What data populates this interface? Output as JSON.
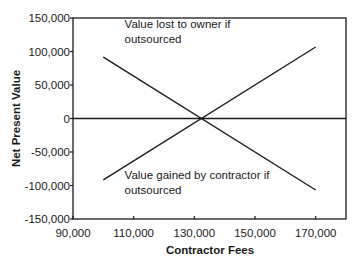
{
  "chart_data": {
    "type": "line",
    "title": "",
    "xlabel": "Contractor Fees",
    "ylabel": "Net Present Value",
    "xlim": [
      90000,
      180000
    ],
    "ylim": [
      -150000,
      150000
    ],
    "x_ticks": [
      90000,
      110000,
      130000,
      150000,
      170000
    ],
    "x_tick_labels": [
      "90,000",
      "110,000",
      "130,000",
      "150,000",
      "170,000"
    ],
    "y_ticks": [
      150000,
      100000,
      50000,
      0,
      -50000,
      -100000,
      -150000
    ],
    "y_tick_labels": [
      "150,000",
      "100,000",
      "50,000",
      "0",
      "-50,000",
      "-100,000",
      "-150,000"
    ],
    "grid": false,
    "zero_line": true,
    "legend": "none (inline annotations)",
    "series": [
      {
        "name": "Value lost to owner if outsourced",
        "x": [
          100000,
          170000
        ],
        "y": [
          91700,
          -106700
        ]
      },
      {
        "name": "Value gained by contractor if outsourced",
        "x": [
          100000,
          170000
        ],
        "y": [
          -91700,
          106700
        ]
      }
    ],
    "annotations": [
      {
        "lines": [
          "Value lost to owner if",
          "outsourced"
        ],
        "x": 107000,
        "y": 135000
      },
      {
        "lines": [
          "Value gained by contractor if",
          "outsourced"
        ],
        "x": 107000,
        "y": -90000
      }
    ],
    "crossover_x": 132300
  },
  "colors": {
    "line": "#1a1a1a",
    "axis": "#1a1a1a",
    "background": "#ffffff"
  }
}
